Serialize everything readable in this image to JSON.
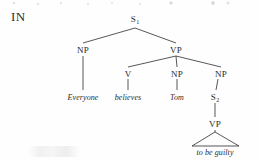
{
  "figure": {
    "corner_label": "IN",
    "type": "syntactic-tree-diagram",
    "sentence": "Everyone believes Tom to be guilty"
  },
  "nodes": {
    "s1": {
      "label": "S",
      "subscript": "1"
    },
    "np_subj": {
      "label": "NP"
    },
    "vp_main": {
      "label": "VP"
    },
    "v": {
      "label": "V"
    },
    "np_obj": {
      "label": "NP"
    },
    "np_clause": {
      "label": "NP"
    },
    "s2": {
      "label": "S",
      "subscript": "2"
    },
    "vp_embed": {
      "label": "VP"
    }
  },
  "leaves": {
    "everyone": "Everyone",
    "believes": "believes",
    "tom": "Tom",
    "to_be_guilty": "to be guilty"
  },
  "colors": {
    "ink": "#2b2b2b",
    "line": "#3a3a3a",
    "background": "#fefefe"
  }
}
